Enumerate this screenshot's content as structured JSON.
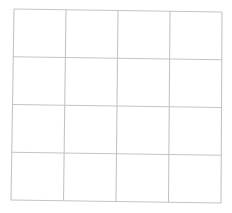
{
  "diagram": {
    "type": "grid",
    "rows": 4,
    "columns": 4,
    "cells_empty": true,
    "line_color": "#c4c4c4",
    "background_color": "#ffffff",
    "corners": {
      "top_left": [
        14,
        9
      ],
      "top_right": [
        222,
        12
      ],
      "bottom_left": [
        11,
        200
      ],
      "bottom_right": [
        221,
        203
      ]
    }
  }
}
